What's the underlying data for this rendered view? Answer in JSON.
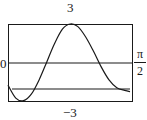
{
  "chart_data": {
    "type": "line",
    "title": "",
    "xlabel": "",
    "ylabel": "",
    "xlim": [
      0,
      "pi/2"
    ],
    "ylim": [
      -3,
      3
    ],
    "grid": false,
    "legend": null,
    "tick_labels": {
      "y_top": "3",
      "y_bottom": "-3",
      "y_zero": "0",
      "x_right_num": "π",
      "x_right_den": "2"
    },
    "series": [
      {
        "name": "curve",
        "style": "line",
        "x": [
          0,
          0.1,
          0.2,
          0.3,
          0.4,
          0.5,
          0.6,
          0.7,
          0.8,
          0.9,
          1.0,
          1.1,
          1.2,
          1.3,
          1.4,
          1.5,
          1.57
        ],
        "y": [
          -1.7,
          -2.7,
          -2.9,
          -2.4,
          -1.3,
          0.1,
          1.5,
          2.6,
          3.0,
          2.8,
          2.0,
          0.9,
          -0.3,
          -1.3,
          -1.9,
          -2.1,
          -2.2
        ]
      },
      {
        "name": "x-axis (y=0)",
        "style": "hline",
        "y": 0
      },
      {
        "name": "horizontal line",
        "style": "hline",
        "y": -2
      }
    ]
  },
  "labels": {
    "top": "3",
    "bottom": "−3",
    "zero": "0",
    "right_num": "π",
    "right_den": "2"
  }
}
